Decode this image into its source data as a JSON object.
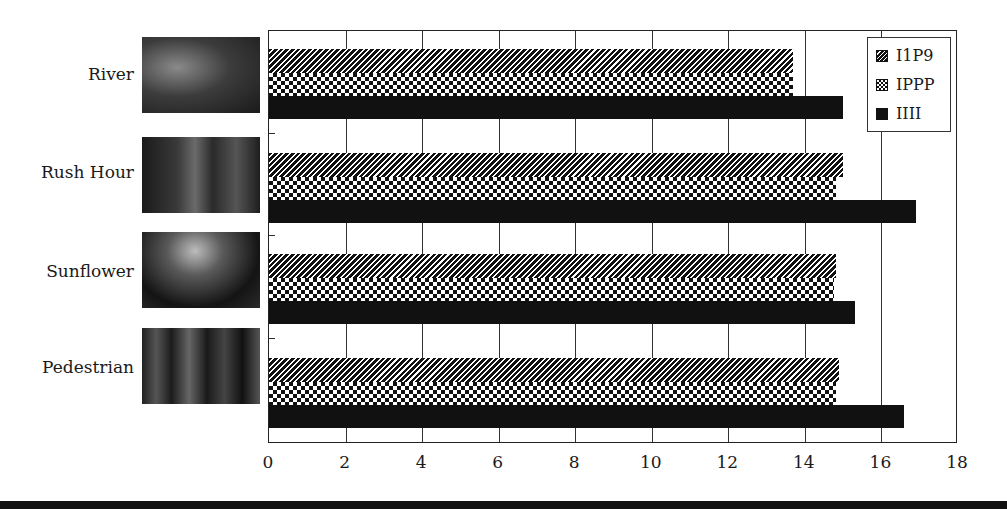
{
  "chart_data": {
    "type": "bar",
    "orientation": "horizontal",
    "title": "",
    "xlabel": "",
    "ylabel": "",
    "categories": [
      "River",
      "Rush Hour",
      "Sunflower",
      "Pedestrian"
    ],
    "series": [
      {
        "name": "I1P9",
        "pattern": "diagonal-hatch",
        "values": [
          13.7,
          15.0,
          14.8,
          14.9
        ]
      },
      {
        "name": "IPPP",
        "pattern": "checkerboard",
        "values": [
          13.7,
          14.8,
          14.75,
          14.8
        ]
      },
      {
        "name": "IIII",
        "pattern": "solid-black",
        "values": [
          15.0,
          16.9,
          15.3,
          16.6
        ]
      }
    ],
    "xlim": [
      0,
      18
    ],
    "xticks": [
      "0",
      "2",
      "4",
      "6",
      "8",
      "10",
      "12",
      "14",
      "16",
      "18"
    ],
    "grid": "vertical",
    "legend_position": "top-right",
    "category_thumbnails": true
  },
  "colors": {
    "bar_fill": "#111111",
    "grid": "#333333",
    "background": "#ffffff"
  }
}
